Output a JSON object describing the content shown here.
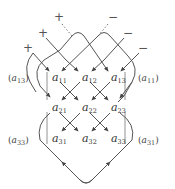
{
  "diagram": {
    "matrix": [
      [
        {
          "base": "a",
          "sub": "11"
        },
        {
          "base": "a",
          "sub": "12"
        },
        {
          "base": "a",
          "sub": "13"
        }
      ],
      [
        {
          "base": "a",
          "sub": "21"
        },
        {
          "base": "a",
          "sub": "22"
        },
        {
          "base": "a",
          "sub": "23"
        }
      ],
      [
        {
          "base": "a",
          "sub": "31"
        },
        {
          "base": "a",
          "sub": "32"
        },
        {
          "base": "a",
          "sub": "33"
        }
      ]
    ],
    "side_labels": {
      "row1_left": {
        "open": "(",
        "base": "a",
        "sub": "13",
        "close": ")"
      },
      "row1_right": {
        "open": "(",
        "base": "a",
        "sub": "11",
        "close": ")"
      },
      "row3_left": {
        "open": "(",
        "base": "a",
        "sub": "33",
        "close": ")"
      },
      "row3_right": {
        "open": "(",
        "base": "a",
        "sub": "31",
        "close": ")"
      }
    },
    "signs": {
      "plus": [
        "+",
        "+",
        "+"
      ],
      "minus": [
        "−",
        "−",
        "−"
      ]
    },
    "colors": {
      "line": "#555555",
      "text": "#333333",
      "background": "#ffffff"
    }
  }
}
